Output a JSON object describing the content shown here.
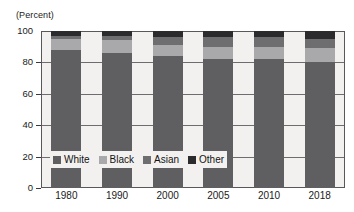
{
  "chart_data": {
    "type": "bar",
    "subtype": "stacked-vertical-100pct",
    "title": "",
    "xlabel": "",
    "ylabel": "(Percent)",
    "categories": [
      "1980",
      "1990",
      "2000",
      "2005",
      "2010",
      "2018"
    ],
    "series": [
      {
        "name": "White",
        "color": "#5f5f61",
        "values": [
          88,
          86,
          84,
          82,
          82,
          80
        ]
      },
      {
        "name": "Black",
        "color": "#a9a9ab",
        "values": [
          7,
          8,
          7,
          8,
          8,
          9
        ]
      },
      {
        "name": "Asian",
        "color": "#6e6e70",
        "values": [
          2,
          3,
          5,
          6,
          6,
          6
        ]
      },
      {
        "name": "Other",
        "color": "#2b2b2d",
        "values": [
          3,
          3,
          4,
          4,
          4,
          5
        ]
      }
    ],
    "yticks": [
      "0",
      "20",
      "40",
      "60",
      "80",
      "100"
    ],
    "ytick_values": [
      0,
      20,
      40,
      60,
      80,
      100
    ],
    "ylim": [
      0,
      100
    ],
    "grid": true,
    "legend_position": "inside-bottom-left",
    "legend": [
      "White",
      "Black",
      "Asian",
      "Other"
    ],
    "plot_background": "#f2f1ef",
    "axis_color": "#58575a",
    "text_color": "#1a1a1a"
  }
}
